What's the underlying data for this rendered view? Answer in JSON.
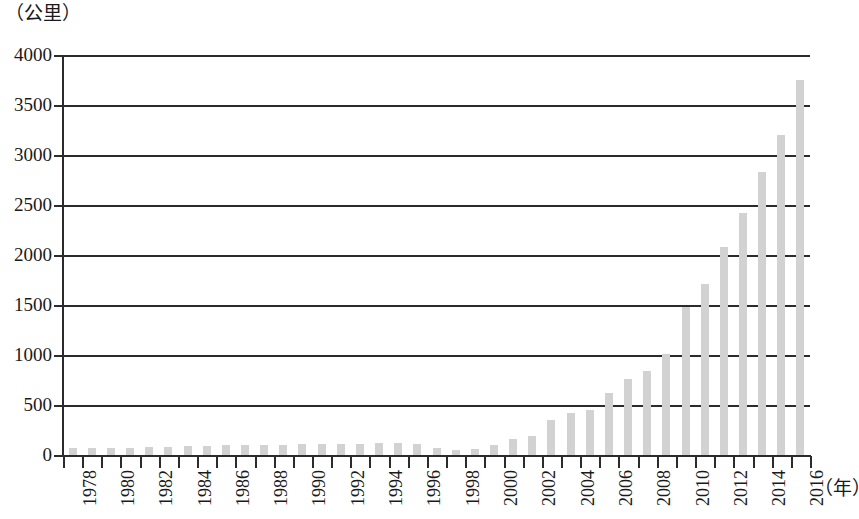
{
  "chart_data": {
    "type": "bar",
    "title": "",
    "subtitle": "",
    "xlabel": "（年）",
    "ylabel": "（公里）",
    "ylim": [
      0,
      4000
    ],
    "xlim": [
      1977.5,
      2016.5
    ],
    "grid": true,
    "legend": null,
    "bar_color": "#d2d2d2",
    "axis_color": "#2b2b2b",
    "y_ticks": [
      4000,
      3500,
      3000,
      2500,
      2000,
      1500,
      1000,
      500,
      0
    ],
    "y_tick_labels": [
      "4000",
      "3500",
      "3000",
      "2500",
      "2000",
      "1500",
      "1000",
      "500",
      "0"
    ],
    "x_tick_labels": [
      "1978",
      "",
      "1980",
      "",
      "1982",
      "",
      "1984",
      "",
      "1986",
      "",
      "1988",
      "",
      "1990",
      "",
      "1992",
      "",
      "1994",
      "",
      "1996",
      "",
      "1998",
      "",
      "2000",
      "",
      "2002",
      "",
      "2004",
      "",
      "2006",
      "",
      "2008",
      "",
      "2010",
      "",
      "2012",
      "",
      "2014",
      "",
      "2016"
    ],
    "categories": [
      1978,
      1979,
      1980,
      1981,
      1982,
      1983,
      1984,
      1985,
      1986,
      1987,
      1988,
      1989,
      1990,
      1991,
      1992,
      1993,
      1994,
      1995,
      1996,
      1997,
      1998,
      1999,
      2000,
      2001,
      2002,
      2003,
      2004,
      2005,
      2006,
      2007,
      2008,
      2009,
      2010,
      2011,
      2012,
      2013,
      2014,
      2015,
      2016
    ],
    "values": [
      70,
      70,
      75,
      75,
      80,
      85,
      95,
      95,
      100,
      100,
      105,
      105,
      110,
      110,
      115,
      115,
      125,
      125,
      110,
      75,
      55,
      60,
      100,
      160,
      190,
      350,
      420,
      450,
      620,
      760,
      840,
      1010,
      1480,
      1710,
      2080,
      2420,
      2830,
      3200,
      3750
    ]
  }
}
